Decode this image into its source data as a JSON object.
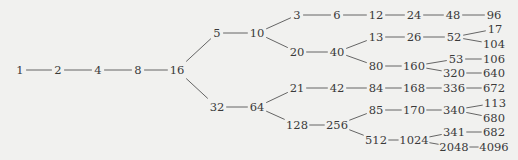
{
  "diagram": {
    "title": "",
    "colors": {
      "background": "#f1f1ef",
      "text": "#3a3a3a",
      "edge": "#555555"
    },
    "nodes": [
      {
        "id": "n1",
        "label": "1",
        "x": 20,
        "y": 70
      },
      {
        "id": "n2",
        "label": "2",
        "x": 58,
        "y": 70
      },
      {
        "id": "n4",
        "label": "4",
        "x": 98,
        "y": 70
      },
      {
        "id": "n8",
        "label": "8",
        "x": 138,
        "y": 70
      },
      {
        "id": "n16",
        "label": "16",
        "x": 177,
        "y": 70
      },
      {
        "id": "n5",
        "label": "5",
        "x": 217,
        "y": 33
      },
      {
        "id": "n10",
        "label": "10",
        "x": 257,
        "y": 33
      },
      {
        "id": "n32",
        "label": "32",
        "x": 217,
        "y": 107
      },
      {
        "id": "n64",
        "label": "64",
        "x": 257,
        "y": 107
      },
      {
        "id": "n3",
        "label": "3",
        "x": 297,
        "y": 15
      },
      {
        "id": "n6",
        "label": "6",
        "x": 337,
        "y": 15
      },
      {
        "id": "n12",
        "label": "12",
        "x": 376,
        "y": 15
      },
      {
        "id": "n24",
        "label": "24",
        "x": 414,
        "y": 15
      },
      {
        "id": "n48",
        "label": "48",
        "x": 453,
        "y": 15
      },
      {
        "id": "n96",
        "label": "96",
        "x": 494,
        "y": 15
      },
      {
        "id": "n20",
        "label": "20",
        "x": 297,
        "y": 52
      },
      {
        "id": "n40",
        "label": "40",
        "x": 337,
        "y": 52
      },
      {
        "id": "n13",
        "label": "13",
        "x": 376,
        "y": 37
      },
      {
        "id": "n26",
        "label": "26",
        "x": 414,
        "y": 37
      },
      {
        "id": "n52",
        "label": "52",
        "x": 454,
        "y": 37
      },
      {
        "id": "n17",
        "label": "17",
        "x": 495,
        "y": 29
      },
      {
        "id": "n104",
        "label": "104",
        "x": 494,
        "y": 44
      },
      {
        "id": "n80",
        "label": "80",
        "x": 376,
        "y": 66
      },
      {
        "id": "n160",
        "label": "160",
        "x": 414,
        "y": 66
      },
      {
        "id": "n53",
        "label": "53",
        "x": 456,
        "y": 59
      },
      {
        "id": "n106",
        "label": "106",
        "x": 494,
        "y": 59
      },
      {
        "id": "n320",
        "label": "320",
        "x": 454,
        "y": 73
      },
      {
        "id": "n640",
        "label": "640",
        "x": 494,
        "y": 73
      },
      {
        "id": "n21",
        "label": "21",
        "x": 297,
        "y": 88
      },
      {
        "id": "n42",
        "label": "42",
        "x": 337,
        "y": 88
      },
      {
        "id": "n84",
        "label": "84",
        "x": 376,
        "y": 88
      },
      {
        "id": "n168",
        "label": "168",
        "x": 414,
        "y": 88
      },
      {
        "id": "n336",
        "label": "336",
        "x": 454,
        "y": 88
      },
      {
        "id": "n672",
        "label": "672",
        "x": 494,
        "y": 88
      },
      {
        "id": "n128",
        "label": "128",
        "x": 297,
        "y": 125
      },
      {
        "id": "n256",
        "label": "256",
        "x": 337,
        "y": 125
      },
      {
        "id": "n85",
        "label": "85",
        "x": 376,
        "y": 110
      },
      {
        "id": "n170",
        "label": "170",
        "x": 414,
        "y": 110
      },
      {
        "id": "n340",
        "label": "340",
        "x": 454,
        "y": 110
      },
      {
        "id": "n113",
        "label": "113",
        "x": 495,
        "y": 103
      },
      {
        "id": "n680",
        "label": "680",
        "x": 494,
        "y": 118
      },
      {
        "id": "n512",
        "label": "512",
        "x": 376,
        "y": 140
      },
      {
        "id": "n1024",
        "label": "1024",
        "x": 414,
        "y": 140
      },
      {
        "id": "n341",
        "label": "341",
        "x": 454,
        "y": 132
      },
      {
        "id": "n682",
        "label": "682",
        "x": 494,
        "y": 132
      },
      {
        "id": "n2048",
        "label": "2048",
        "x": 454,
        "y": 147
      },
      {
        "id": "n4096",
        "label": "4096",
        "x": 494,
        "y": 147
      }
    ],
    "edges": [
      [
        "n1",
        "n2"
      ],
      [
        "n2",
        "n4"
      ],
      [
        "n4",
        "n8"
      ],
      [
        "n8",
        "n16"
      ],
      [
        "n16",
        "n5"
      ],
      [
        "n16",
        "n32"
      ],
      [
        "n5",
        "n10"
      ],
      [
        "n32",
        "n64"
      ],
      [
        "n10",
        "n3"
      ],
      [
        "n10",
        "n20"
      ],
      [
        "n3",
        "n6"
      ],
      [
        "n6",
        "n12"
      ],
      [
        "n12",
        "n24"
      ],
      [
        "n24",
        "n48"
      ],
      [
        "n48",
        "n96"
      ],
      [
        "n20",
        "n40"
      ],
      [
        "n40",
        "n13"
      ],
      [
        "n40",
        "n80"
      ],
      [
        "n13",
        "n26"
      ],
      [
        "n26",
        "n52"
      ],
      [
        "n52",
        "n17"
      ],
      [
        "n52",
        "n104"
      ],
      [
        "n80",
        "n160"
      ],
      [
        "n160",
        "n53"
      ],
      [
        "n160",
        "n320"
      ],
      [
        "n53",
        "n106"
      ],
      [
        "n320",
        "n640"
      ],
      [
        "n64",
        "n21"
      ],
      [
        "n64",
        "n128"
      ],
      [
        "n21",
        "n42"
      ],
      [
        "n42",
        "n84"
      ],
      [
        "n84",
        "n168"
      ],
      [
        "n168",
        "n336"
      ],
      [
        "n336",
        "n672"
      ],
      [
        "n128",
        "n256"
      ],
      [
        "n256",
        "n85"
      ],
      [
        "n256",
        "n512"
      ],
      [
        "n85",
        "n170"
      ],
      [
        "n170",
        "n340"
      ],
      [
        "n340",
        "n113"
      ],
      [
        "n340",
        "n680"
      ],
      [
        "n512",
        "n1024"
      ],
      [
        "n1024",
        "n341"
      ],
      [
        "n1024",
        "n2048"
      ],
      [
        "n341",
        "n682"
      ],
      [
        "n2048",
        "n4096"
      ]
    ]
  }
}
